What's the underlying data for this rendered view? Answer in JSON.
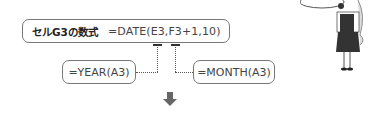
{
  "main": {
    "label": "セルG3の数式",
    "formula": "=DATE(E3,F3+1,10)"
  },
  "year_box": {
    "formula": "=YEAR(A3)"
  },
  "month_box": {
    "formula": "=MONTH(A3)"
  },
  "colors": {
    "border": "#777777",
    "text": "#333333",
    "arrow": "#666666"
  }
}
